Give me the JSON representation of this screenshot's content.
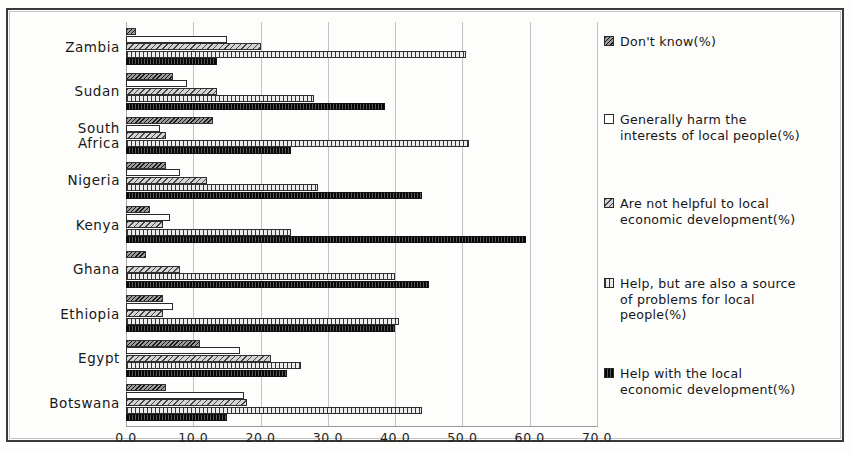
{
  "chart_data": {
    "type": "bar",
    "orientation": "horizontal",
    "title": "",
    "xlabel": "",
    "ylabel": "",
    "xlim": [
      0,
      70
    ],
    "xticks": [
      "0.0",
      "10.0",
      "20.0",
      "30.0",
      "40.0",
      "50.0",
      "60.0",
      "70.0"
    ],
    "xtick_values": [
      0,
      10,
      20,
      30,
      40,
      50,
      60,
      70
    ],
    "grid": "vertical",
    "legend_position": "right",
    "categories": [
      "Zambia",
      "Sudan",
      "South Africa",
      "Nigeria",
      "Kenya",
      "Ghana",
      "Ethiopia",
      "Egypt",
      "Botswana"
    ],
    "series": [
      {
        "name": "Don't know(%)",
        "pattern": "dark-diagonal-hatch",
        "values": [
          1.5,
          7.0,
          13.0,
          6.0,
          3.5,
          3.0,
          5.5,
          11.0,
          6.0
        ]
      },
      {
        "name": "Generally harm the interests of local people(%)",
        "pattern": "white-outline",
        "values": [
          15.0,
          9.0,
          5.0,
          8.0,
          6.5,
          0.0,
          7.0,
          17.0,
          17.5
        ]
      },
      {
        "name": "Are not helpful to local economic development(%)",
        "pattern": "light-diagonal-hatch",
        "values": [
          20.0,
          13.5,
          6.0,
          12.0,
          5.5,
          8.0,
          5.5,
          21.5,
          18.0
        ]
      },
      {
        "name": "Help, but are also a source of problems for local people(%)",
        "pattern": "vertical-hatch",
        "values": [
          50.5,
          28.0,
          51.0,
          28.5,
          24.5,
          40.0,
          40.5,
          26.0,
          44.0
        ]
      },
      {
        "name": "Help with the local economic development(%)",
        "pattern": "solid-black",
        "values": [
          13.5,
          38.5,
          24.5,
          44.0,
          59.5,
          45.0,
          40.0,
          24.0,
          15.0
        ]
      }
    ],
    "legend_entries": [
      "Don't know(%)",
      "Generally harm the interests of local people(%)",
      "Are not helpful to local economic development(%)",
      "Help, but are also a source of problems for local people(%)",
      "Help with the local economic development(%)"
    ],
    "legend_lines": [
      [
        "Don't know(%)"
      ],
      [
        "Generally harm the",
        "interests of local people(%)"
      ],
      [
        "Are not helpful to local",
        "economic development(%)"
      ],
      [
        "Help, but are also a source",
        "of problems for local",
        "people(%)"
      ],
      [
        "Help with the local",
        "economic development(%)"
      ]
    ],
    "category_label_lines": [
      [
        "Zambia"
      ],
      [
        "Sudan"
      ],
      [
        "South",
        "Africa"
      ],
      [
        "Nigeria"
      ],
      [
        "Kenya"
      ],
      [
        "Ghana"
      ],
      [
        "Ethiopia"
      ],
      [
        "Egypt"
      ],
      [
        "Botswana"
      ]
    ]
  },
  "colors": {
    "dontknow": "#6e6e6e",
    "harm": "#ffffff",
    "nothelp": "#a9a9a9",
    "helpbut": "#c2c2c2",
    "helpwith": "#262626",
    "gridline": "#b9b9b9",
    "border": "#3a3a3a",
    "text": "#181818"
  }
}
